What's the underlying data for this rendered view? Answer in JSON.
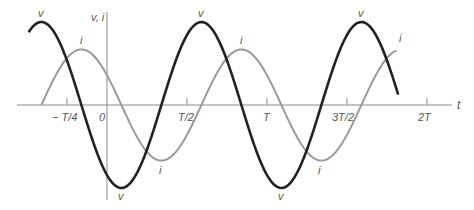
{
  "chart_data": {
    "type": "line",
    "title": "",
    "xlabel": "t",
    "ylabel": "v, i",
    "grid": false,
    "legend": "none (curves labeled inline)",
    "x_ticks": [
      {
        "label": "− T/4",
        "value": -0.25
      },
      {
        "label": "0",
        "value": 0
      },
      {
        "label": "T/2",
        "value": 0.5
      },
      {
        "label": "T",
        "value": 1.0
      },
      {
        "label": "3T/2",
        "value": 1.5
      },
      {
        "label": "2T",
        "value": 2.0
      }
    ],
    "x_unit": "T (period)",
    "x_range": [
      -0.5,
      1.8
    ],
    "series": [
      {
        "name": "v",
        "description": "voltage, sinusoid, larger amplitude",
        "amplitude": 1.0,
        "peaks_at_t": [
          -0.41,
          0.59,
          1.59
        ],
        "troughs_at_t": [
          0.09,
          1.09
        ],
        "t_start": -0.49,
        "t_end": 1.82,
        "color": "#222222"
      },
      {
        "name": "i",
        "description": "current, sinusoid, lags v by T/4 (90 degrees)",
        "amplitude": 0.67,
        "peaks_at_t": [
          -0.16,
          0.84,
          1.84
        ],
        "troughs_at_t": [
          0.34,
          1.34
        ],
        "t_start": -0.41,
        "t_end": 1.81,
        "color": "#9a9a9a"
      }
    ],
    "phase_relation": "i lags v by T/4"
  },
  "labels": {
    "y_axis": "v, i",
    "x_axis": "t",
    "v_label": "v",
    "i_label": "i"
  },
  "colors": {
    "v_curve": "#222222",
    "i_curve": "#9a9a9a",
    "axis": "#8a8a8a",
    "text": "#555555"
  }
}
